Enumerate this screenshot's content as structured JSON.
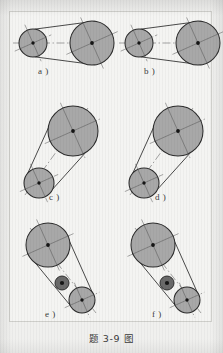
{
  "figure": {
    "caption": "题 3-9 图",
    "frame_border_color": "#cfcfcb",
    "page_background": "#f0f0ee",
    "panel_background": "#f4f4f2"
  },
  "style": {
    "pulley_fill": "#a8a8a8",
    "pulley_stroke": "#2b2b2b",
    "idler_fill": "#6a6a6a",
    "hub_color": "#151515",
    "belt_color": "#2b2b2b",
    "centerline_color": "#5a5a5a"
  },
  "panels": [
    {
      "id": "a",
      "label": "a )",
      "label_x": 38,
      "label_y": 70,
      "arrangement": "horizontal",
      "description": "open belt drive, small driver left, large driven right",
      "pulleys": [
        {
          "name": "small-pulley",
          "cx": 33,
          "cy": 43,
          "r": 14
        },
        {
          "name": "large-pulley",
          "cx": 92,
          "cy": 43,
          "r": 22
        }
      ],
      "idler": null,
      "centerline": {
        "x1": 13,
        "y1": 43,
        "x2": 113,
        "y2": 43
      }
    },
    {
      "id": "b",
      "label": "b )",
      "label_x": 144,
      "label_y": 70,
      "arrangement": "horizontal",
      "description": "open belt drive, small driver left, large driven right",
      "pulleys": [
        {
          "name": "small-pulley",
          "cx": 139,
          "cy": 43,
          "r": 14
        },
        {
          "name": "large-pulley",
          "cx": 198,
          "cy": 43,
          "r": 22
        }
      ],
      "idler": null,
      "centerline": {
        "x1": 119,
        "y1": 43,
        "x2": 219,
        "y2": 43
      }
    },
    {
      "id": "c",
      "label": "c )",
      "label_x": 49,
      "label_y": 196,
      "arrangement": "diagonal",
      "description": "inclined belt drive, large pulley upper right, small pulley lower left",
      "pulleys": [
        {
          "name": "large-pulley",
          "cx": 73,
          "cy": 131,
          "r": 25
        },
        {
          "name": "small-pulley",
          "cx": 39,
          "cy": 183,
          "r": 15
        }
      ],
      "idler": null,
      "centerline": {
        "x1": 25,
        "y1": 195,
        "x2": 88,
        "y2": 108
      }
    },
    {
      "id": "d",
      "label": "d )",
      "label_x": 155,
      "label_y": 196,
      "arrangement": "diagonal",
      "description": "inclined belt drive, large pulley upper right, small pulley lower left",
      "pulleys": [
        {
          "name": "large-pulley",
          "cx": 178,
          "cy": 131,
          "r": 25
        },
        {
          "name": "small-pulley",
          "cx": 144,
          "cy": 183,
          "r": 15
        }
      ],
      "idler": null,
      "centerline": {
        "x1": 130,
        "y1": 195,
        "x2": 193,
        "y2": 108
      }
    },
    {
      "id": "e",
      "label": "e )",
      "label_x": 45,
      "label_y": 313,
      "arrangement": "diagonal-with-idler",
      "description": "inclined belt drive with tension idler pulley on slack side",
      "pulleys": [
        {
          "name": "large-pulley",
          "cx": 48,
          "cy": 245,
          "r": 22
        },
        {
          "name": "small-pulley",
          "cx": 82,
          "cy": 300,
          "r": 13
        }
      ],
      "idler": {
        "name": "idler-pulley",
        "cx": 62,
        "cy": 283,
        "r": 7
      },
      "centerline": {
        "x1": 30,
        "y1": 228,
        "x2": 96,
        "y2": 313
      }
    },
    {
      "id": "f",
      "label": "f )",
      "label_x": 152,
      "label_y": 313,
      "arrangement": "diagonal-with-idler",
      "description": "inclined belt drive with tension idler pulley on slack side",
      "pulleys": [
        {
          "name": "large-pulley",
          "cx": 153,
          "cy": 245,
          "r": 22
        },
        {
          "name": "small-pulley",
          "cx": 187,
          "cy": 300,
          "r": 13
        }
      ],
      "idler": {
        "name": "idler-pulley",
        "cx": 167,
        "cy": 283,
        "r": 7
      },
      "centerline": {
        "x1": 135,
        "y1": 228,
        "x2": 201,
        "y2": 313
      }
    }
  ]
}
